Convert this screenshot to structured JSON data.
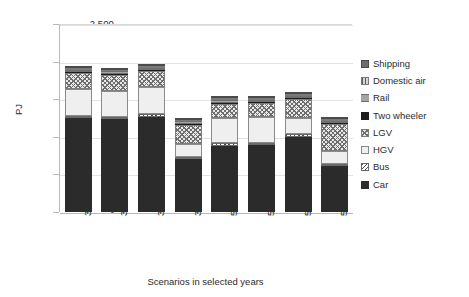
{
  "chart_data": {
    "type": "bar",
    "title": "",
    "subtitle": "",
    "xlabel": "Scenarios in selected years",
    "ylabel": "PJ",
    "ylim": [
      0,
      2500
    ],
    "ytick_values": [
      0,
      500,
      1000,
      1500,
      2000,
      2500
    ],
    "ytick_labels": [
      "-",
      "500",
      "1,000",
      "1,500",
      "2,000",
      "2,500"
    ],
    "grid": true,
    "stacked": true,
    "legend_position": "right",
    "legend_order_top_to_bottom": [
      "Shipping",
      "Domestic air",
      "Rail",
      "Two wheeler",
      "LGV",
      "HGV",
      "Bus",
      "Car"
    ],
    "stack_order_bottom_to_top": [
      "Car",
      "Bus",
      "HGV",
      "LGV",
      "Two wheeler",
      "Rail",
      "Domestic air",
      "Shipping"
    ],
    "categories": [
      "35-LC",
      "35-LC-EA",
      "35-LC-LC",
      "35-LC-SO",
      "50-LC",
      "50-LC-EA",
      "50-LC-LC",
      "50-LC-SO"
    ],
    "series": [
      {
        "name": "Car",
        "values": [
          1245,
          1235,
          1270,
          700,
          880,
          885,
          1000,
          610
        ]
      },
      {
        "name": "Bus",
        "values": [
          35,
          35,
          35,
          35,
          35,
          35,
          35,
          35
        ]
      },
      {
        "name": "HGV",
        "values": [
          355,
          345,
          355,
          175,
          340,
          340,
          215,
          160
        ]
      },
      {
        "name": "LGV",
        "values": [
          215,
          210,
          210,
          250,
          185,
          185,
          250,
          365
        ]
      },
      {
        "name": "Two wheeler",
        "values": [
          15,
          15,
          15,
          15,
          15,
          15,
          15,
          15
        ]
      },
      {
        "name": "Rail",
        "values": [
          30,
          30,
          30,
          30,
          30,
          30,
          30,
          30
        ]
      },
      {
        "name": "Domestic air",
        "values": [
          25,
          25,
          25,
          25,
          25,
          25,
          25,
          25
        ]
      },
      {
        "name": "Shipping",
        "values": [
          25,
          25,
          25,
          25,
          25,
          25,
          25,
          25
        ]
      }
    ],
    "totals": [
      1945,
      1920,
      1965,
      1255,
      1510,
      1515,
      1600,
      1250
    ]
  },
  "legend": {
    "items": [
      {
        "label": "Shipping",
        "pattern": "p-ship"
      },
      {
        "label": "Domestic air",
        "pattern": "p-air"
      },
      {
        "label": "Rail",
        "pattern": "p-rail"
      },
      {
        "label": "Two wheeler",
        "pattern": "p-tw"
      },
      {
        "label": "LGV",
        "pattern": "p-lgv"
      },
      {
        "label": "HGV",
        "pattern": "p-hgv"
      },
      {
        "label": "Bus",
        "pattern": "p-bus"
      },
      {
        "label": "Car",
        "pattern": "p-car"
      }
    ]
  }
}
